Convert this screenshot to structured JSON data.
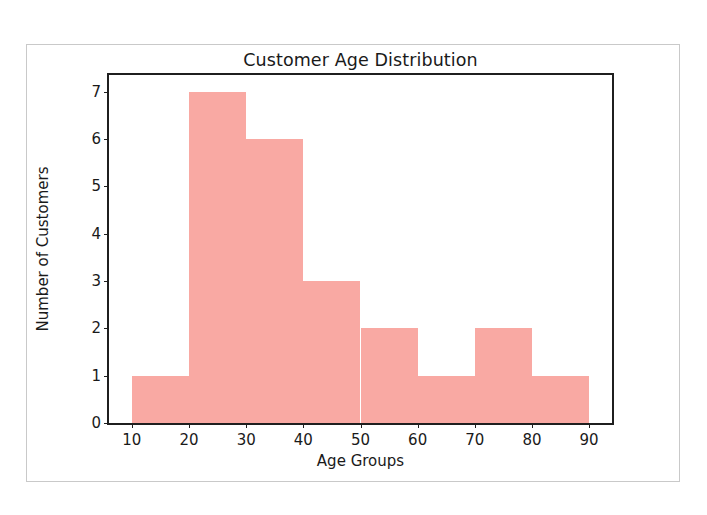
{
  "figure": {
    "background_color": "#ffffff",
    "border_color": "#c9c9c9",
    "axes_color": "#1f1f1f"
  },
  "chart_data": {
    "type": "bar",
    "title": "Customer Age Distribution",
    "xlabel": "Age Groups",
    "ylabel": "Number of Customers",
    "bar_color": "#f9a9a3",
    "grid": false,
    "legend": null,
    "bin_edges": [
      10,
      20,
      30,
      40,
      50,
      60,
      70,
      80,
      90
    ],
    "categories": [
      "10-20",
      "20-30",
      "30-40",
      "40-50",
      "50-60",
      "60-70",
      "70-80",
      "80-90"
    ],
    "values": [
      1,
      7,
      6,
      3,
      2,
      1,
      2,
      1
    ],
    "bars": [
      {
        "bin_start": 10,
        "bin_end": 20,
        "value": 1
      },
      {
        "bin_start": 20,
        "bin_end": 30,
        "value": 7
      },
      {
        "bin_start": 30,
        "bin_end": 40,
        "value": 6
      },
      {
        "bin_start": 40,
        "bin_end": 50,
        "value": 3
      },
      {
        "bin_start": 50,
        "bin_end": 60,
        "value": 2
      },
      {
        "bin_start": 60,
        "bin_end": 70,
        "value": 1
      },
      {
        "bin_start": 70,
        "bin_end": 80,
        "value": 2
      },
      {
        "bin_start": 80,
        "bin_end": 90,
        "value": 1
      }
    ],
    "xlim": [
      6,
      94
    ],
    "ylim": [
      0,
      7.35
    ],
    "xticks": [
      10,
      20,
      30,
      40,
      50,
      60,
      70,
      80,
      90
    ],
    "xtick_labels": [
      "10",
      "20",
      "30",
      "40",
      "50",
      "60",
      "70",
      "80",
      "90"
    ],
    "yticks": [
      0,
      1,
      2,
      3,
      4,
      5,
      6,
      7
    ],
    "ytick_labels": [
      "0",
      "1",
      "2",
      "3",
      "4",
      "5",
      "6",
      "7"
    ]
  }
}
